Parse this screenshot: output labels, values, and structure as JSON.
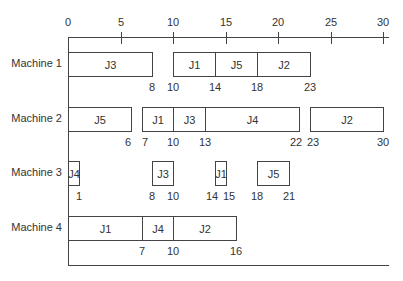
{
  "chart_data": {
    "type": "gantt",
    "title": "",
    "xlabel": "",
    "ylabel": "",
    "xlim": [
      0,
      30
    ],
    "x_ticks": [
      0,
      5,
      10,
      15,
      20,
      25,
      30
    ],
    "machines": [
      {
        "name": "Machine 1",
        "jobs": [
          {
            "job": "J3",
            "start": 0,
            "end": 8
          },
          {
            "job": "J1",
            "start": 10,
            "end": 14
          },
          {
            "job": "J5",
            "start": 14,
            "end": 18
          },
          {
            "job": "J2",
            "start": 18,
            "end": 23
          }
        ],
        "time_labels": [
          "8",
          "10",
          "14",
          "18",
          "23"
        ]
      },
      {
        "name": "Machine 2",
        "jobs": [
          {
            "job": "J5",
            "start": 0,
            "end": 6
          },
          {
            "job": "J1",
            "start": 7,
            "end": 10
          },
          {
            "job": "J3",
            "start": 10,
            "end": 13
          },
          {
            "job": "J4",
            "start": 13,
            "end": 22
          },
          {
            "job": "J2",
            "start": 23,
            "end": 30
          }
        ],
        "time_labels": [
          "6",
          "7",
          "10",
          "13",
          "22",
          "23",
          "30"
        ]
      },
      {
        "name": "Machine 3",
        "jobs": [
          {
            "job": "J4",
            "start": 0,
            "end": 1
          },
          {
            "job": "J3",
            "start": 8,
            "end": 10
          },
          {
            "job": "J1",
            "start": 14,
            "end": 15
          },
          {
            "job": "J5",
            "start": 18,
            "end": 21
          }
        ],
        "time_labels": [
          "1",
          "8",
          "10",
          "14",
          "15",
          "18",
          "21"
        ]
      },
      {
        "name": "Machine 4",
        "jobs": [
          {
            "job": "J1",
            "start": 0,
            "end": 7
          },
          {
            "job": "J4",
            "start": 7,
            "end": 10
          },
          {
            "job": "J2",
            "start": 10,
            "end": 16
          }
        ],
        "time_labels": [
          "7",
          "10",
          "16"
        ]
      }
    ]
  },
  "axis": {
    "ticks": [
      "0",
      "5",
      "10",
      "15",
      "20",
      "25",
      "30"
    ]
  },
  "rows": [
    {
      "label": "Machine 1"
    },
    {
      "label": "Machine 2"
    },
    {
      "label": "Machine 3"
    },
    {
      "label": "Machine 4"
    }
  ],
  "colors": {
    "line": "#444444",
    "text": "#333333",
    "box_fill": "#ffffff"
  }
}
